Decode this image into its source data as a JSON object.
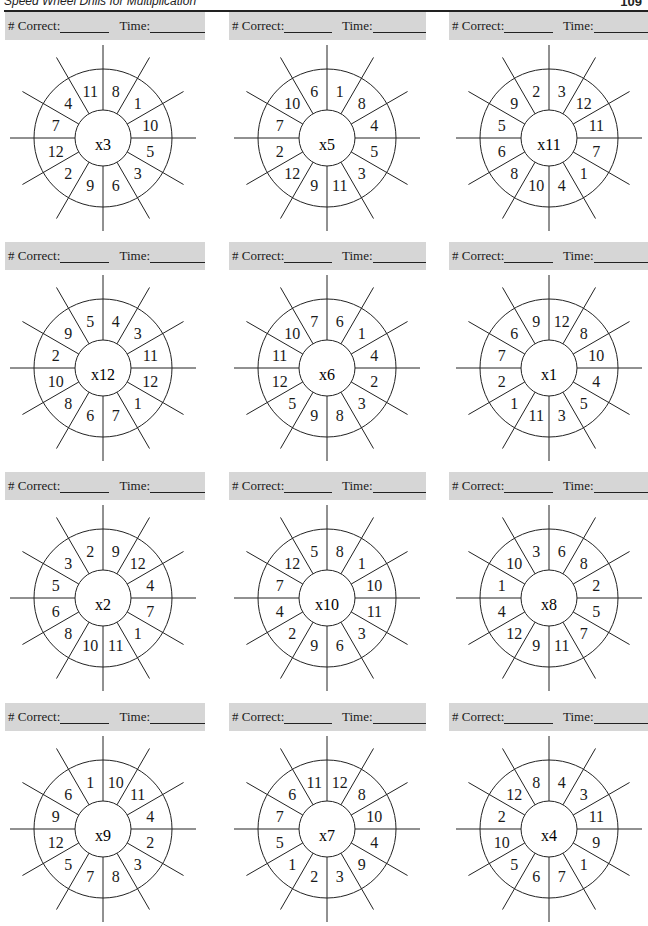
{
  "header": {
    "title": "Speed Wheel Drills for Multiplication",
    "page_number": "109"
  },
  "score_labels": {
    "correct": "# Correct:",
    "time": "Time:"
  },
  "colors": {
    "score_bar": "#d6d6d6",
    "ink": "#1a1a1a"
  },
  "wheels": [
    {
      "factor": "3",
      "times": "x",
      "numbers": [
        "8",
        "1",
        "10",
        "5",
        "3",
        "6",
        "9",
        "2",
        "12",
        "7",
        "4",
        "11"
      ]
    },
    {
      "factor": "5",
      "times": "x",
      "numbers": [
        "1",
        "8",
        "4",
        "5",
        "3",
        "11",
        "9",
        "12",
        "2",
        "7",
        "10",
        "6"
      ]
    },
    {
      "factor": "11",
      "times": "x",
      "numbers": [
        "3",
        "12",
        "11",
        "7",
        "1",
        "4",
        "10",
        "8",
        "6",
        "5",
        "9",
        "2"
      ]
    },
    {
      "factor": "12",
      "times": "x",
      "numbers": [
        "4",
        "3",
        "11",
        "12",
        "1",
        "7",
        "6",
        "8",
        "10",
        "2",
        "9",
        "5"
      ]
    },
    {
      "factor": "6",
      "times": "x",
      "numbers": [
        "6",
        "1",
        "4",
        "2",
        "3",
        "8",
        "9",
        "5",
        "12",
        "11",
        "10",
        "7"
      ]
    },
    {
      "factor": "1",
      "times": "x",
      "numbers": [
        "12",
        "8",
        "10",
        "4",
        "5",
        "3",
        "11",
        "1",
        "2",
        "7",
        "6",
        "9"
      ]
    },
    {
      "factor": "2",
      "times": "x",
      "numbers": [
        "9",
        "12",
        "4",
        "7",
        "1",
        "11",
        "10",
        "8",
        "6",
        "5",
        "3",
        "2"
      ]
    },
    {
      "factor": "10",
      "times": "x",
      "numbers": [
        "8",
        "1",
        "10",
        "11",
        "3",
        "6",
        "9",
        "2",
        "4",
        "7",
        "12",
        "5"
      ]
    },
    {
      "factor": "8",
      "times": "x",
      "numbers": [
        "6",
        "8",
        "2",
        "5",
        "7",
        "11",
        "9",
        "12",
        "4",
        "1",
        "10",
        "3"
      ]
    },
    {
      "factor": "9",
      "times": "x",
      "numbers": [
        "10",
        "11",
        "4",
        "2",
        "3",
        "8",
        "7",
        "5",
        "12",
        "9",
        "6",
        "1"
      ]
    },
    {
      "factor": "7",
      "times": "x",
      "numbers": [
        "12",
        "8",
        "10",
        "4",
        "9",
        "3",
        "2",
        "1",
        "5",
        "7",
        "6",
        "11"
      ]
    },
    {
      "factor": "4",
      "times": "x",
      "numbers": [
        "4",
        "3",
        "11",
        "9",
        "1",
        "7",
        "6",
        "5",
        "10",
        "2",
        "12",
        "8"
      ]
    }
  ]
}
